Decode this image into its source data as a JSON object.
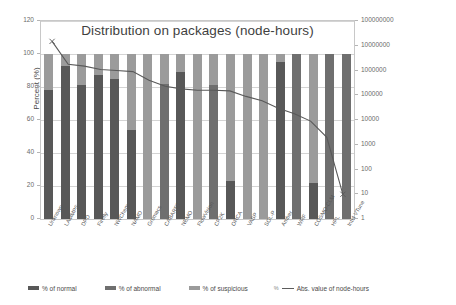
{
  "chart_data": {
    "type": "bar",
    "title": "Distribution on packages (node-hours)",
    "xlabel": "",
    "ylabel": "Percent (%)",
    "y2label": "Absolute value of node-hours",
    "ylim": [
      0,
      120
    ],
    "yticks": [
      0,
      20,
      40,
      60,
      80,
      100,
      120
    ],
    "y2lim": [
      1,
      100000000
    ],
    "y2scale": "log",
    "y2ticks": [
      1,
      10,
      100,
      1000,
      10000,
      100000,
      1000000,
      10000000,
      100000000
    ],
    "grid": true,
    "legend_position": "bottom",
    "stacked": true,
    "categories": [
      "Unknown",
      "LAMMPS",
      "DPD",
      "Firefly",
      "NWChem",
      "NAMD",
      "Gromacs",
      "CABARET",
      "NEMO",
      "FlowVision",
      "CP2K",
      "ORCA",
      "VASP",
      "SOL-P",
      "Amber",
      "WRF",
      "COSMO-CLM",
      "HPL",
      "Intel VTune"
    ],
    "series": [
      {
        "name": "% of normal",
        "values": [
          78,
          93,
          81,
          87,
          85,
          54,
          0,
          0,
          89,
          0,
          0,
          23,
          0,
          0,
          95,
          0,
          22,
          0,
          0
        ]
      },
      {
        "name": "% of abnormal",
        "values": [
          0,
          0,
          0,
          0,
          0,
          0,
          0,
          82,
          0,
          0,
          81,
          0,
          0,
          0,
          0,
          100,
          0,
          100,
          100
        ]
      },
      {
        "name": "% of suspicious",
        "values": [
          22,
          7,
          19,
          13,
          15,
          46,
          100,
          18,
          11,
          100,
          19,
          77,
          100,
          100,
          5,
          0,
          78,
          0,
          0
        ]
      },
      {
        "name": "Abs. value of node-hours",
        "axis": "y2",
        "values": [
          15000000,
          1800000,
          1500000,
          1100000,
          1000000,
          900000,
          400000,
          230000,
          180000,
          160000,
          160000,
          150000,
          90000,
          60000,
          30000,
          18000,
          9000,
          2000,
          10
        ]
      }
    ]
  },
  "legend": {
    "items": [
      {
        "label": "% of normal",
        "color": "#585858",
        "type": "swatch"
      },
      {
        "label": "% of abnormal",
        "color": "#6f6f6f",
        "type": "swatch"
      },
      {
        "label": "% of suspicious",
        "color": "#9b9b9b",
        "type": "swatch"
      },
      {
        "label": "Abs. value of node-hours",
        "color": "#5c5c5c",
        "type": "line",
        "prefix": "%"
      }
    ]
  }
}
